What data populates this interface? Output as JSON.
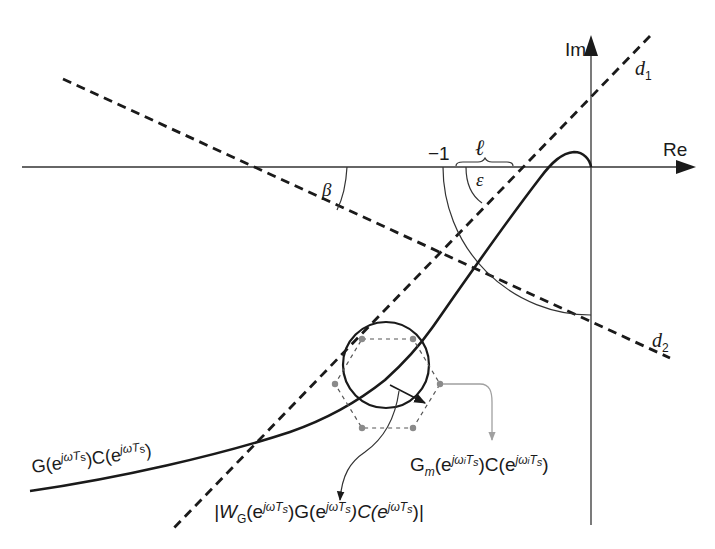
{
  "diagram": {
    "type": "nyquist-plot",
    "axes": {
      "real_label": "Re",
      "imag_label": "Im",
      "minus_one_label": "−1"
    },
    "lines": {
      "d1_label": "d",
      "d1_sub": "1",
      "d2_label": "d",
      "d2_sub": "2"
    },
    "angles": {
      "beta": "β",
      "epsilon": "ε"
    },
    "distance_label": "ℓ",
    "curve_label": {
      "base": "G(e",
      "sup1": "jωT",
      "sub1": "s",
      "mid": ")C(e",
      "sup2": "jωT",
      "sub2": "s",
      "end": ")"
    },
    "uncertainty_label": {
      "open": "|W",
      "sub_g": "G",
      "p1": "(e",
      "sup1": "jωT",
      "sub1": "s",
      "p2": ")G(e",
      "sup2": "jωT",
      "sub2": "s",
      "p3": ")C(e",
      "sup3": "jωT",
      "sub3": "s",
      "close": ")|"
    },
    "model_label": {
      "g": "G",
      "sub_m": "m",
      "p1": "(e",
      "sup1": "jω",
      "sup1_i": "i",
      "sup1_t": "T",
      "sub1": "s",
      "p2": ")C(e",
      "sup2": "jω",
      "sup2_i": "i",
      "sup2_t": "T",
      "sub2": "s",
      "close": ")"
    },
    "colors": {
      "line": "#1a1a1a",
      "gray_arrow": "#a0a0a0",
      "marker": "#8a8a8a"
    }
  }
}
